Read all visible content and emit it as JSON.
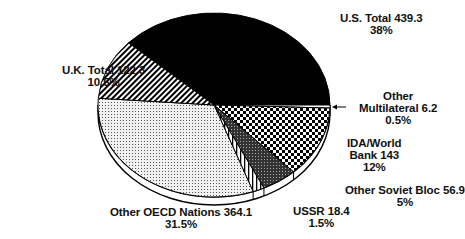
{
  "chart_data": {
    "type": "pie",
    "title": "",
    "unit": "",
    "slices": [
      {
        "name": "U.S. Total",
        "value": 439.3,
        "percent": 38,
        "label_lines": [
          "U.S. Total 439.3",
          "38%"
        ],
        "pattern": "solid-black"
      },
      {
        "name": "Other Multilateral",
        "value": 6.2,
        "percent": 0.5,
        "label_lines": [
          "Other",
          "Multilateral 6.2",
          "0.5%"
        ],
        "pattern": "white",
        "arrow": true
      },
      {
        "name": "IDA/World Bank",
        "value": 143,
        "percent": 12,
        "label_lines": [
          "IDA/World",
          "Bank 143",
          "12%"
        ],
        "pattern": "checker"
      },
      {
        "name": "Other Soviet Bloc",
        "value": 56.9,
        "percent": 5,
        "label_lines": [
          "Other Soviet Bloc 56.9",
          "5%"
        ],
        "pattern": "dark-dots"
      },
      {
        "name": "USSR",
        "value": 18.4,
        "percent": 1.5,
        "label_lines": [
          "USSR 18.4",
          "1.5%"
        ],
        "pattern": "vertical-lines"
      },
      {
        "name": "Other OECD Nations",
        "value": 364.1,
        "percent": 31.5,
        "label_lines": [
          "Other OECD Nations 364.1",
          "31.5%"
        ],
        "pattern": "light-dots"
      },
      {
        "name": "U.K. Total",
        "value": 122.3,
        "percent": 10.5,
        "label_lines": [
          "U.K. Total 122.3",
          "10.5%"
        ],
        "pattern": "diagonal-lines"
      }
    ],
    "legend": "none"
  }
}
